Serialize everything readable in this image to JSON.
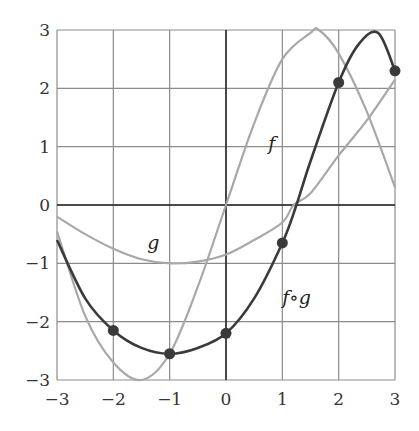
{
  "chart_data": {
    "type": "line",
    "title": "",
    "xlabel": "",
    "ylabel": "",
    "xlim": [
      -3,
      3
    ],
    "ylim": [
      -3,
      3
    ],
    "grid": true,
    "x_ticks": [
      "−3",
      "−2",
      "−1",
      "0",
      "1",
      "2",
      "3"
    ],
    "y_ticks": [
      "3",
      "2",
      "1",
      "0",
      "−1",
      "−2",
      "−3"
    ],
    "series": [
      {
        "name": "f",
        "color": "#a8a8a8",
        "x": [
          -3,
          -2.5,
          -2,
          -1.5,
          -1,
          -0.5,
          0,
          0.5,
          1,
          1.5,
          1.65,
          2,
          2.5,
          3
        ],
        "y": [
          -0.45,
          -1.9,
          -2.7,
          -3.0,
          -2.55,
          -1.4,
          0,
          1.4,
          2.5,
          2.95,
          3.0,
          2.6,
          1.6,
          0.3
        ]
      },
      {
        "name": "g",
        "color": "#a8a8a8",
        "x": [
          -3,
          -2.5,
          -2,
          -1.5,
          -1,
          -0.5,
          0,
          0.5,
          1,
          1.2,
          1.5,
          2,
          2.5,
          3
        ],
        "y": [
          -0.2,
          -0.5,
          -0.75,
          -0.93,
          -1.0,
          -0.97,
          -0.85,
          -0.6,
          -0.3,
          0,
          0.2,
          0.85,
          1.45,
          2.15
        ]
      },
      {
        "name": "f∘g",
        "color": "#3a3a3a",
        "x": [
          -3,
          -2.5,
          -2,
          -1.5,
          -1,
          -0.5,
          0,
          0.5,
          1,
          1.25,
          1.5,
          2,
          2.35,
          2.7,
          3
        ],
        "y": [
          -0.6,
          -1.6,
          -2.15,
          -2.45,
          -2.55,
          -2.45,
          -2.2,
          -1.6,
          -0.65,
          0,
          0.75,
          2.1,
          2.75,
          2.95,
          2.3
        ],
        "markers": {
          "x": [
            -2,
            -1,
            0,
            1,
            2,
            3
          ],
          "y": [
            -2.15,
            -2.55,
            -2.2,
            -0.65,
            2.1,
            2.3
          ]
        }
      }
    ],
    "annotations": [
      {
        "text": "f",
        "x": 0.75,
        "y": 0.95
      },
      {
        "text": "g",
        "x": -1.4,
        "y": -0.75
      },
      {
        "text": "f∘g",
        "x": 1.0,
        "y": -1.7
      }
    ]
  },
  "labels": {
    "f": "f",
    "g": "g",
    "fog": "f∘g"
  }
}
